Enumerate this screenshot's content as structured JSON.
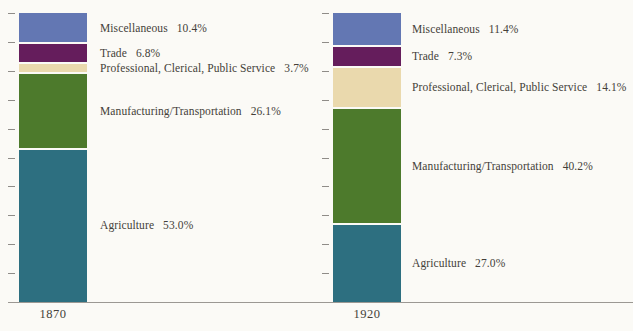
{
  "figure": {
    "background_color": "#fbfaf6",
    "text_color": "#443f39",
    "axis_color": "#9b9893"
  },
  "chart_data": [
    {
      "type": "bar",
      "stacked": true,
      "x_tick_label": "1870",
      "ylim": [
        0,
        100
      ],
      "y_unit": "percent",
      "y_tick_interval": 10,
      "grid": false,
      "legend": "inline-right-labels",
      "segments": [
        {
          "category": "Miscellaneous",
          "value": 10.4,
          "pct_label": "10.4%",
          "color": "#6377b3"
        },
        {
          "category": "Trade",
          "value": 6.8,
          "pct_label": "6.8%",
          "color": "#651d5c"
        },
        {
          "category": "Professional, Clerical, Public Service",
          "value": 3.7,
          "pct_label": "3.7%",
          "color": "#ead9ad"
        },
        {
          "category": "Manufacturing/Transportation",
          "value": 26.1,
          "pct_label": "26.1%",
          "color": "#4d7a2c"
        },
        {
          "category": "Agriculture",
          "value": 53.0,
          "pct_label": "53.0%",
          "color": "#2d6f80"
        }
      ]
    },
    {
      "type": "bar",
      "stacked": true,
      "x_tick_label": "1920",
      "ylim": [
        0,
        100
      ],
      "y_unit": "percent",
      "y_tick_interval": 10,
      "grid": false,
      "legend": "inline-right-labels",
      "segments": [
        {
          "category": "Miscellaneous",
          "value": 11.4,
          "pct_label": "11.4%",
          "color": "#6377b3"
        },
        {
          "category": "Trade",
          "value": 7.3,
          "pct_label": "7.3%",
          "color": "#651d5c"
        },
        {
          "category": "Professional, Clerical, Public Service",
          "value": 14.1,
          "pct_label": "14.1%",
          "color": "#ead9ad"
        },
        {
          "category": "Manufacturing/Transportation",
          "value": 40.2,
          "pct_label": "40.2%",
          "color": "#4d7a2c"
        },
        {
          "category": "Agriculture",
          "value": 27.0,
          "pct_label": "27.0%",
          "color": "#2d6f80"
        }
      ]
    }
  ]
}
